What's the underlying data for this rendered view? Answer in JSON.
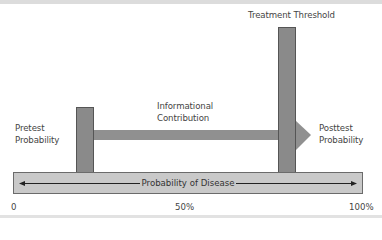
{
  "diagram": {
    "labels": {
      "treatment_threshold": "Treatment Threshold",
      "informational_line1": "Informational",
      "informational_line2": "Contribution",
      "pretest_line1": "Pretest",
      "pretest_line2": "Probability",
      "posttest_line1": "Posttest",
      "posttest_line2": "Probability",
      "axis_band": "Probability of Disease"
    },
    "axis_ticks": [
      "0",
      "50%",
      "100%"
    ],
    "colors": {
      "bar_fill": "#8a8a8a",
      "bar_border": "#555555",
      "arrow_fill": "#909090",
      "band_fill": "#c9c9c9",
      "band_border": "#6b6b6b"
    },
    "positions": {
      "pretest_probability": "~17%",
      "treatment_threshold": "~77%",
      "posttest_probability": "~87%"
    }
  }
}
